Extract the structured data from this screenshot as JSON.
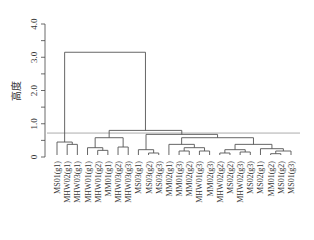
{
  "chart_data": {
    "type": "dendrogram",
    "title": "",
    "xlabel": "",
    "ylabel": "高度",
    "ylim": [
      0,
      4.0
    ],
    "yticks": [
      0,
      1.0,
      2.0,
      3.0,
      4.0
    ],
    "ytick_labels": [
      "0",
      "1.0",
      "2.0",
      "3.0",
      "4.0"
    ],
    "cut_height": 0.72,
    "leaves": [
      "MS01(g1)",
      "MHW02(g1)",
      "MHW03(g1)",
      "MHW01(g1)",
      "MHW01(g2)",
      "MM01(g1)",
      "MHW03(g2)",
      "MHW03(g3)",
      "MS03(g1)",
      "MS03(g2)",
      "MS03(g3)",
      "MM02(g1)",
      "MM01(g3)",
      "MM02(g2)",
      "MHW01(g3)",
      "MM02(g3)",
      "MHW02(g2)",
      "MS02(g2)",
      "MHW02(g3)",
      "MS02(g3)",
      "MS02(g1)",
      "MM01(g2)",
      "MS01(g2)",
      "MS01(g3)"
    ],
    "merges": [
      {
        "id": "a",
        "children": [
          "L1",
          "L2"
        ],
        "height": 0.38
      },
      {
        "id": "b",
        "children": [
          "L0",
          "a"
        ],
        "height": 0.45
      },
      {
        "id": "c",
        "children": [
          "L4",
          "L5"
        ],
        "height": 0.2
      },
      {
        "id": "d",
        "children": [
          "L3",
          "c"
        ],
        "height": 0.28
      },
      {
        "id": "e",
        "children": [
          "L6",
          "L7"
        ],
        "height": 0.3
      },
      {
        "id": "f",
        "children": [
          "d",
          "e"
        ],
        "height": 0.58
      },
      {
        "id": "g",
        "children": [
          "L9",
          "L10"
        ],
        "height": 0.12
      },
      {
        "id": "h",
        "children": [
          "L8",
          "g"
        ],
        "height": 0.22
      },
      {
        "id": "i",
        "children": [
          "L12",
          "L13"
        ],
        "height": 0.18
      },
      {
        "id": "j",
        "children": [
          "L14",
          "L15"
        ],
        "height": 0.18
      },
      {
        "id": "k",
        "children": [
          "i",
          "j"
        ],
        "height": 0.28
      },
      {
        "id": "l",
        "children": [
          "L11",
          "k"
        ],
        "height": 0.38
      },
      {
        "id": "m",
        "children": [
          "L16",
          "L17"
        ],
        "height": 0.12
      },
      {
        "id": "n",
        "children": [
          "L18",
          "L19"
        ],
        "height": 0.15
      },
      {
        "id": "o",
        "children": [
          "m",
          "n"
        ],
        "height": 0.22
      },
      {
        "id": "p",
        "children": [
          "L21",
          "L22"
        ],
        "height": 0.1
      },
      {
        "id": "q",
        "children": [
          "p",
          "L23"
        ],
        "height": 0.18
      },
      {
        "id": "r",
        "children": [
          "L20",
          "q"
        ],
        "height": 0.25
      },
      {
        "id": "s",
        "children": [
          "o",
          "r"
        ],
        "height": 0.38
      },
      {
        "id": "t",
        "children": [
          "l",
          "s"
        ],
        "height": 0.58
      },
      {
        "id": "u",
        "children": [
          "h",
          "t"
        ],
        "height": 0.68
      },
      {
        "id": "v",
        "children": [
          "f",
          "u"
        ],
        "height": 0.8
      },
      {
        "id": "root",
        "children": [
          "b",
          "v"
        ],
        "height": 3.15
      }
    ]
  }
}
